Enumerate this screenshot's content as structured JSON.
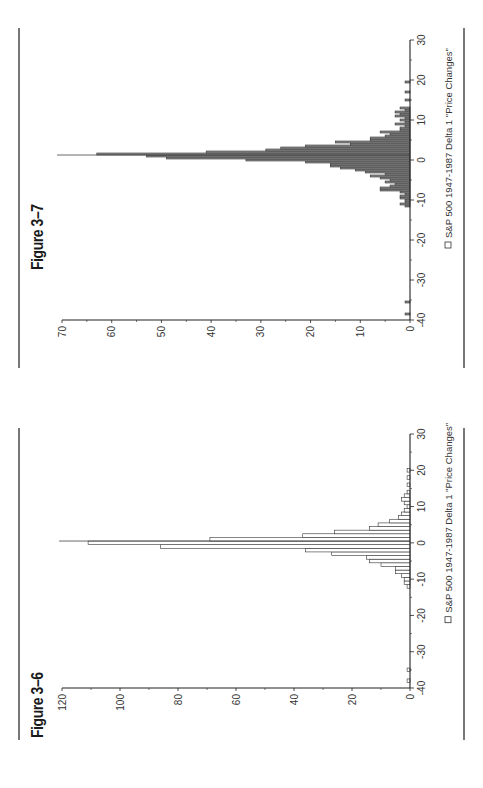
{
  "page": {
    "figures": [
      {
        "id": "fig-3-6",
        "title": "Figure 3–6",
        "legend": "S&P 500 1947-1987 Delta 1 \"Price Changes\""
      },
      {
        "id": "fig-3-7",
        "title": "Figure 3–7",
        "legend": "S&P 500 1947-1987 Delta 1 \"Price Changes\""
      }
    ]
  },
  "chart_data": [
    {
      "type": "bar",
      "title": "Figure 3–6",
      "legend": [
        "S&P 500 1947-1987 Delta 1 \"Price Changes\""
      ],
      "bar_fill": "#ffffff",
      "bar_stroke": "#333333",
      "xlabel": "",
      "ylabel": "",
      "xlim": [
        -40,
        30
      ],
      "ylim": [
        0,
        120
      ],
      "xticks": [
        -40,
        -30,
        -20,
        -10,
        0,
        10,
        20,
        30
      ],
      "yticks": [
        0,
        20,
        40,
        60,
        80,
        100,
        120
      ],
      "bin_width": 1,
      "x": [
        -38,
        -35,
        -12,
        -11,
        -10,
        -9,
        -8,
        -7,
        -6,
        -5,
        -4,
        -3,
        -2,
        -1,
        0,
        1,
        2,
        3,
        4,
        5,
        6,
        7,
        8,
        9,
        10,
        11,
        12,
        13,
        14,
        16,
        18,
        20
      ],
      "values": [
        1,
        1,
        1,
        2,
        2,
        3,
        5,
        5,
        10,
        14,
        15,
        27,
        36,
        86,
        111,
        69,
        37,
        26,
        14,
        11,
        7,
        4,
        3,
        2,
        1,
        2,
        3,
        2,
        1,
        1,
        1,
        1
      ],
      "spike": {
        "x": 0.5,
        "value": 121
      },
      "grid": false
    },
    {
      "type": "bar",
      "title": "Figure 3–7",
      "legend": [
        "S&P 500 1947-1987 Delta 1 \"Price Changes\""
      ],
      "bar_fill": "#8c8c8c",
      "bar_stroke": "#333333",
      "xlabel": "",
      "ylabel": "",
      "xlim": [
        -40,
        30
      ],
      "ylim": [
        0,
        70
      ],
      "xticks": [
        -40,
        -30,
        -20,
        -10,
        0,
        10,
        20,
        30
      ],
      "yticks": [
        0,
        10,
        20,
        30,
        40,
        50,
        60,
        70
      ],
      "bin_width": 0.5,
      "x": [
        -38.5,
        -35.5,
        -11.5,
        -11,
        -10.5,
        -10,
        -9.5,
        -9,
        -8.5,
        -8,
        -7.5,
        -7,
        -6.5,
        -6,
        -5.5,
        -5,
        -4.5,
        -4,
        -3.5,
        -3,
        -2.5,
        -2,
        -1.5,
        -1,
        -0.5,
        0,
        0.5,
        1,
        1.5,
        2,
        2.5,
        3,
        3.5,
        4,
        4.5,
        5,
        5.5,
        6,
        6.5,
        7,
        7.5,
        8,
        8.5,
        9,
        9.5,
        10,
        10.5,
        11,
        11.5,
        12,
        12.5,
        13,
        15,
        17,
        19.5
      ],
      "values": [
        1,
        1,
        1,
        2,
        1,
        1,
        2,
        2,
        1,
        2,
        6,
        6,
        4,
        3,
        5,
        4,
        6,
        8,
        5,
        9,
        11,
        14,
        16,
        16,
        21,
        33,
        49,
        53,
        63,
        41,
        29,
        26,
        21,
        12,
        15,
        8,
        8,
        5,
        4,
        6,
        2,
        2,
        1,
        3,
        1,
        2,
        1,
        3,
        2,
        3,
        1,
        2,
        1,
        1,
        1
      ],
      "spike": {
        "x": 1.25,
        "value": 71
      },
      "grid": false
    }
  ]
}
